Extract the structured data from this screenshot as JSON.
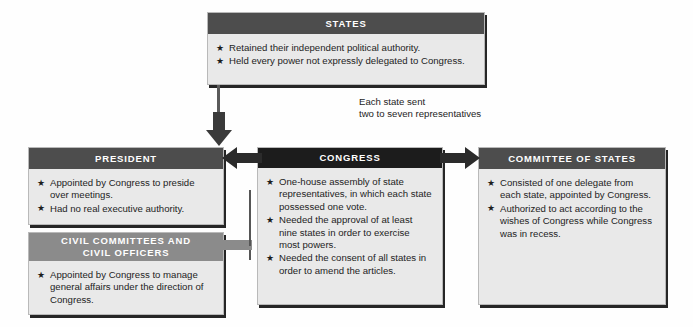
{
  "diagram": {
    "title_caption": "Each state sent\ntwo to seven representatives",
    "colors": {
      "header_dark": "#4d4d4d",
      "header_black": "#1c1c1c",
      "header_mid": "#8b8b8b",
      "body_bg": "#e9e9e9",
      "arrow_dark": "#2b2b2b",
      "arrow_gray": "#8b8b8b",
      "page_bg": "#fefefe"
    },
    "bullet_glyph": "★"
  },
  "boxes": {
    "states": {
      "title": "STATES",
      "bullets": [
        "Retained their independent political authority.",
        "Held every power not expressly delegated to Congress."
      ]
    },
    "president": {
      "title": "PRESIDENT",
      "bullets": [
        "Appointed by Congress to preside over meetings.",
        "Had no real executive authority."
      ]
    },
    "civil": {
      "title_line1": "CIVIL COMMITTEES AND",
      "title_line2": "CIVIL OFFICERS",
      "bullets": [
        "Appointed by Congress to manage general affairs under the direction of Congress."
      ]
    },
    "congress": {
      "title": "CONGRESS",
      "bullets": [
        "One-house assembly of state representatives, in which each state possessed  one vote.",
        "Needed the approval of at least nine states in order to exercise most powers.",
        "Needed the consent of all states in order to amend the articles."
      ]
    },
    "committee": {
      "title": "COMMITTEE OF STATES",
      "bullets": [
        "Consisted of one delegate from each state, appointed by Congress.",
        "Authorized  to act according to the wishes of Congress while Congress was in recess."
      ]
    }
  },
  "connectors": {
    "states_to_congress": {
      "name": "down-arrow",
      "label": "Each state sent\ntwo to seven representatives"
    },
    "congress_to_president": {
      "name": "left-arrow"
    },
    "congress_to_committee": {
      "name": "right-arrow"
    },
    "congress_to_civil": {
      "name": "left-arrow-gray"
    }
  }
}
